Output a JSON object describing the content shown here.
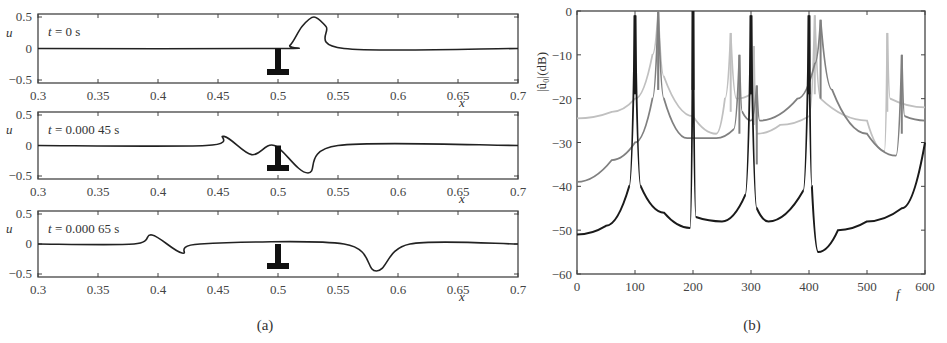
{
  "chart_data": [
    {
      "panel": "a",
      "caption": "(a)",
      "type": "line",
      "layout": "three stacked subplots",
      "xlabel": "x",
      "ylabel": "u",
      "xlim": [
        0.3,
        0.7
      ],
      "ylim": [
        -0.5,
        0.5
      ],
      "xticks": [
        "0.3",
        "0.35",
        "0.4",
        "0.45",
        "0.5",
        "0.55",
        "0.6",
        "0.65",
        "0.7"
      ],
      "yticks": [
        "0.5",
        "0",
        "−0.5"
      ],
      "obstacle": {
        "x": 0.5,
        "description": "T-shaped black marker at x=0.5 below u=0"
      },
      "subplots": [
        {
          "annotation": "t = 0 s",
          "x": [
            0.3,
            0.5,
            0.51,
            0.52,
            0.53,
            0.54,
            0.555,
            0.7
          ],
          "y": [
            0,
            0,
            0.05,
            0.35,
            0.5,
            0.35,
            0.0,
            0.0
          ]
        },
        {
          "annotation": "t = 0.000 45 s",
          "x": [
            0.3,
            0.44,
            0.455,
            0.478,
            0.497,
            0.525,
            0.55,
            0.7
          ],
          "y": [
            0,
            0,
            0.15,
            -0.15,
            0.0,
            -0.45,
            0.0,
            0.0
          ]
        },
        {
          "annotation": "t = 0.000 65 s",
          "x": [
            0.3,
            0.38,
            0.395,
            0.42,
            0.435,
            0.555,
            0.582,
            0.61,
            0.7
          ],
          "y": [
            0,
            0,
            0.15,
            -0.15,
            0.0,
            0.0,
            -0.45,
            0.0,
            0.0
          ]
        }
      ]
    },
    {
      "panel": "b",
      "caption": "(b)",
      "type": "line",
      "xlabel": "f",
      "ylabel": "|û₀|(dB)",
      "xlim": [
        0,
        600
      ],
      "ylim": [
        -60,
        0
      ],
      "xticks": [
        "0",
        "100",
        "200",
        "300",
        "400",
        "500",
        "600"
      ],
      "yticks": [
        "0",
        "−10",
        "−20",
        "−30",
        "−40",
        "−50",
        "−60"
      ],
      "series": [
        {
          "name": "dark curve",
          "color": "#1a1a1a",
          "peaks_f": [
            100,
            200,
            300,
            400
          ],
          "points": [
            [
              0,
              -51
            ],
            [
              50,
              -49
            ],
            [
              90,
              -40
            ],
            [
              100,
              -1
            ],
            [
              110,
              -40
            ],
            [
              150,
              -46
            ],
            [
              195,
              -49.5
            ],
            [
              200,
              0
            ],
            [
              205,
              -47
            ],
            [
              250,
              -48
            ],
            [
              290,
              -42
            ],
            [
              300,
              -1
            ],
            [
              310,
              -45
            ],
            [
              330,
              -48
            ],
            [
              390,
              -41
            ],
            [
              400,
              -1
            ],
            [
              405,
              -40
            ],
            [
              416,
              -55
            ],
            [
              450,
              -50
            ],
            [
              500,
              -48
            ],
            [
              560,
              -45
            ],
            [
              600,
              -30
            ]
          ]
        },
        {
          "name": "medium gray curve",
          "color": "#808080",
          "peaks_f": [
            140,
            280,
            310,
            420,
            560
          ],
          "points": [
            [
              0,
              -39
            ],
            [
              60,
              -34
            ],
            [
              100,
              -30
            ],
            [
              130,
              -20
            ],
            [
              140,
              0
            ],
            [
              150,
              -20
            ],
            [
              190,
              -29
            ],
            [
              240,
              -29
            ],
            [
              270,
              -27
            ],
            [
              280,
              -10
            ],
            [
              285,
              -23
            ],
            [
              300,
              -25
            ],
            [
              310,
              -17
            ],
            [
              315,
              -25
            ],
            [
              380,
              -20
            ],
            [
              410,
              -12
            ],
            [
              420,
              -2
            ],
            [
              440,
              -18
            ],
            [
              500,
              -28
            ],
            [
              550,
              -33
            ],
            [
              560,
              -10
            ],
            [
              565,
              -24
            ],
            [
              600,
              -25
            ]
          ]
        },
        {
          "name": "light gray curve",
          "color": "#c0c0c0",
          "peaks_f": [
            140,
            265,
            305,
            410,
            535
          ],
          "points": [
            [
              0,
              -24.5
            ],
            [
              60,
              -23
            ],
            [
              100,
              -20
            ],
            [
              130,
              -10
            ],
            [
              140,
              0
            ],
            [
              150,
              -15
            ],
            [
              200,
              -24
            ],
            [
              240,
              -28
            ],
            [
              255,
              -20
            ],
            [
              265,
              -5
            ],
            [
              275,
              -20
            ],
            [
              300,
              -19
            ],
            [
              305,
              -8
            ],
            [
              310,
              -28
            ],
            [
              350,
              -26
            ],
            [
              400,
              -24
            ],
            [
              410,
              -1
            ],
            [
              420,
              -20
            ],
            [
              500,
              -25
            ],
            [
              530,
              -32
            ],
            [
              535,
              -5
            ],
            [
              540,
              -20
            ],
            [
              600,
              -22
            ]
          ]
        }
      ]
    }
  ]
}
